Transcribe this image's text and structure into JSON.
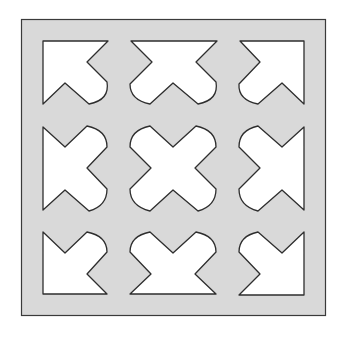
{
  "diagram": {
    "colors": {
      "panel_fill": "#d9d9d9",
      "panel_stroke": "#3a3a3a",
      "cutout_fill": "#ffffff",
      "cutout_stroke": "#2e2e2e",
      "background": "#ffffff"
    },
    "grid": {
      "rows": 3,
      "cols": 3
    },
    "cutouts": [
      {
        "row": 0,
        "col": 0,
        "shape": "corner-arrow",
        "pointing": "top-left"
      },
      {
        "row": 0,
        "col": 1,
        "shape": "edge-half-cross",
        "pointing": "top"
      },
      {
        "row": 0,
        "col": 2,
        "shape": "corner-arrow",
        "pointing": "top-right"
      },
      {
        "row": 1,
        "col": 0,
        "shape": "edge-half-cross",
        "pointing": "left"
      },
      {
        "row": 1,
        "col": 1,
        "shape": "full-cross",
        "pointing": "center"
      },
      {
        "row": 1,
        "col": 2,
        "shape": "edge-half-cross",
        "pointing": "right"
      },
      {
        "row": 2,
        "col": 0,
        "shape": "corner-arrow",
        "pointing": "bottom-left"
      },
      {
        "row": 2,
        "col": 1,
        "shape": "edge-half-cross",
        "pointing": "bottom"
      },
      {
        "row": 2,
        "col": 2,
        "shape": "corner-arrow",
        "pointing": "bottom-right"
      }
    ]
  }
}
